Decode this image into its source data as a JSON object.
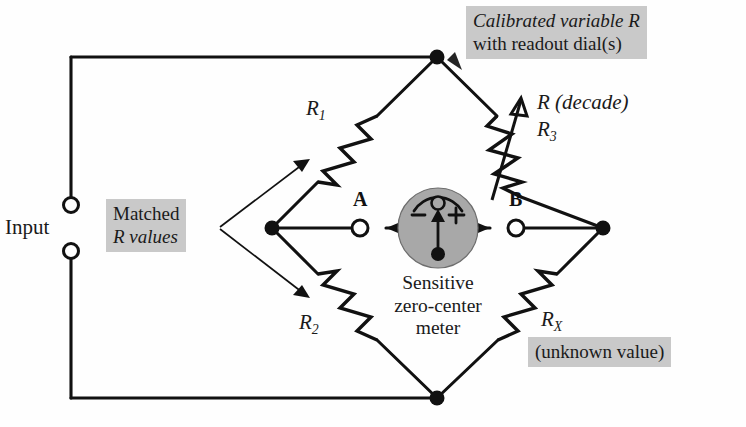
{
  "diagram": {
    "title": "Wheatstone bridge circuit",
    "type": "circuit-schematic",
    "canvas": {
      "width": 746,
      "height": 427
    },
    "colors": {
      "wire": "#111111",
      "callout_background": "#c9c9c9",
      "meter_fill": "#a8a8a8",
      "page_background": "#ffffff",
      "text": "#1a1a1a"
    }
  },
  "input": {
    "label": "Input",
    "terminal_top_name": "input-terminal-top",
    "terminal_bottom_name": "input-terminal-bottom"
  },
  "callouts": {
    "calibrated": {
      "line1": "Calibrated variable R",
      "line2": "with readout dial(s)"
    },
    "matched": {
      "line1": "Matched",
      "line2": "R values"
    },
    "unknown": {
      "line1": "(unknown value)"
    }
  },
  "resistors": [
    {
      "id": "R1",
      "label": "R",
      "subscript": "1",
      "arm": "top-left",
      "variable": false
    },
    {
      "id": "R3",
      "label": "R",
      "subscript": "3",
      "arm": "top-right",
      "variable": true
    },
    {
      "id": "R2",
      "label": "R",
      "subscript": "2",
      "arm": "bottom-left",
      "variable": false
    },
    {
      "id": "RX",
      "label": "R",
      "subscript": "X",
      "arm": "bottom-right",
      "variable": false
    }
  ],
  "decade": {
    "label": "R (decade)",
    "label_italic_part": "R",
    "label_rest": "(decade)"
  },
  "meter": {
    "caption_line1": "Sensitive",
    "caption_line2": "zero-center",
    "caption_line3": "meter",
    "minus_sign": "–",
    "plus_sign": "+",
    "left_terminal_letter": "A",
    "right_terminal_letter": "B",
    "needle_direction": "up-center"
  },
  "nodes": {
    "top": {
      "name": "bridge-node-top",
      "x": 437,
      "y": 57
    },
    "left": {
      "name": "bridge-node-left",
      "x": 272,
      "y": 228
    },
    "right": {
      "name": "bridge-node-right",
      "x": 603,
      "y": 228
    },
    "bottom": {
      "name": "bridge-node-bottom",
      "x": 437,
      "y": 398
    }
  }
}
